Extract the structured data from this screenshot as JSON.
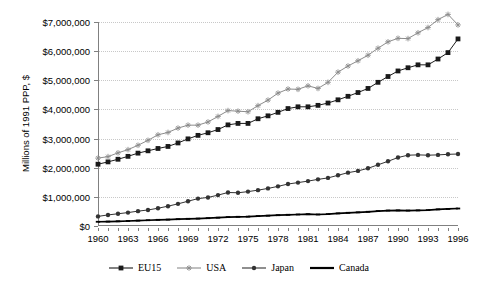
{
  "chart_data": {
    "type": "line",
    "title": "",
    "xlabel": "",
    "ylabel": "Millions of 1991 PPP, $",
    "grid": true,
    "legend_position": "bottom",
    "ylim": [
      0,
      7000000
    ],
    "xlim": [
      1960,
      1996
    ],
    "y_ticks": [
      0,
      1000000,
      2000000,
      3000000,
      4000000,
      5000000,
      6000000,
      7000000
    ],
    "y_tick_labels": [
      "$0",
      "$1,000,000",
      "$2,000,000",
      "$3,000,000",
      "$4,000,000",
      "$5,000,000",
      "$6,000,000",
      "$7,000,000"
    ],
    "x_tick_labels": [
      "1960",
      "1963",
      "1966",
      "1969",
      "1972",
      "1975",
      "1978",
      "1981",
      "1984",
      "1987",
      "1990",
      "1993",
      "1996"
    ],
    "x": [
      1960,
      1961,
      1962,
      1963,
      1964,
      1965,
      1966,
      1967,
      1968,
      1969,
      1970,
      1971,
      1972,
      1973,
      1974,
      1975,
      1976,
      1977,
      1978,
      1979,
      1980,
      1981,
      1982,
      1983,
      1984,
      1985,
      1986,
      1987,
      1988,
      1989,
      1990,
      1991,
      1992,
      1993,
      1994,
      1995,
      1996
    ],
    "series": [
      {
        "name": "EU15",
        "color": "#1a1a1a",
        "marker": "square",
        "values": [
          2120000,
          2200000,
          2290000,
          2390000,
          2500000,
          2580000,
          2660000,
          2730000,
          2850000,
          2990000,
          3110000,
          3200000,
          3310000,
          3470000,
          3520000,
          3520000,
          3680000,
          3780000,
          3900000,
          4030000,
          4090000,
          4090000,
          4140000,
          4220000,
          4330000,
          4450000,
          4580000,
          4720000,
          4930000,
          5130000,
          5320000,
          5430000,
          5530000,
          5530000,
          5730000,
          5950000,
          6420000
        ]
      },
      {
        "name": "USA",
        "color": "#8c8c8c",
        "marker": "star",
        "values": [
          2330000,
          2380000,
          2510000,
          2620000,
          2770000,
          2940000,
          3130000,
          3210000,
          3360000,
          3460000,
          3460000,
          3570000,
          3760000,
          3960000,
          3940000,
          3920000,
          4130000,
          4320000,
          4560000,
          4700000,
          4690000,
          4810000,
          4720000,
          4930000,
          5280000,
          5490000,
          5670000,
          5860000,
          6100000,
          6320000,
          6440000,
          6430000,
          6630000,
          6810000,
          7080000,
          7260000,
          6900000
        ]
      },
      {
        "name": "Japan",
        "color": "#333333",
        "marker": "circle",
        "values": [
          330000,
          380000,
          420000,
          460000,
          510000,
          550000,
          610000,
          680000,
          760000,
          850000,
          940000,
          980000,
          1060000,
          1150000,
          1140000,
          1180000,
          1230000,
          1290000,
          1360000,
          1440000,
          1490000,
          1540000,
          1600000,
          1650000,
          1740000,
          1830000,
          1890000,
          1980000,
          2100000,
          2220000,
          2350000,
          2430000,
          2440000,
          2430000,
          2440000,
          2460000,
          2470000
        ]
      },
      {
        "name": "Canada",
        "color": "#000000",
        "marker": "dash",
        "values": [
          145000,
          152000,
          162000,
          172000,
          185000,
          198000,
          212000,
          220000,
          233000,
          247000,
          255000,
          268000,
          285000,
          305000,
          316000,
          322000,
          340000,
          354000,
          370000,
          385000,
          395000,
          405000,
          395000,
          408000,
          432000,
          453000,
          468000,
          488000,
          512000,
          530000,
          535000,
          530000,
          535000,
          545000,
          570000,
          585000,
          600000
        ]
      }
    ]
  },
  "legend": {
    "items": [
      {
        "label": "EU15"
      },
      {
        "label": "USA"
      },
      {
        "label": "Japan"
      },
      {
        "label": "Canada"
      }
    ]
  }
}
